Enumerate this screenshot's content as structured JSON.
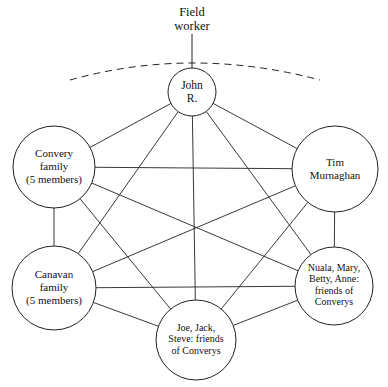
{
  "diagram": {
    "type": "sociogram-network",
    "background_color": "#ffffff",
    "stroke_color": "#222222",
    "text_color": "#111111",
    "width": 388,
    "height": 387,
    "caption": {
      "name": "field-worker-caption",
      "lines": [
        "Field",
        "worker"
      ],
      "line1": "Field",
      "line2": "worker",
      "x": 192,
      "y": 16,
      "line_height": 14,
      "font_size": 12.5
    },
    "boundary_arc": {
      "name": "dashed-boundary-arc",
      "path": "M 70 80 Q 192 46 320 80",
      "dash_pattern": "7 5"
    },
    "field_worker_stem": {
      "name": "field-worker-connector",
      "x": 192,
      "y1": 34,
      "y2": 68
    },
    "nodes": [
      {
        "id": "john-r",
        "label": "John R.",
        "lines": [
          "John",
          "R."
        ],
        "cx": 192,
        "cy": 92,
        "r": 24,
        "font_size": 11.5,
        "line_height": 13
      },
      {
        "id": "convery-family",
        "label": "Convery family (5 members)",
        "lines": [
          "Convery",
          "family",
          "(5 members)"
        ],
        "cx": 54,
        "cy": 167,
        "r": 41,
        "font_size": 11,
        "line_height": 13
      },
      {
        "id": "tim-murnaghan",
        "label": "Tim Murnaghan",
        "lines": [
          "Tim",
          "Murnaghan"
        ],
        "cx": 335,
        "cy": 169,
        "r": 43,
        "font_size": 11,
        "line_height": 13
      },
      {
        "id": "canavan-family",
        "label": "Canavan family (5 members)",
        "lines": [
          "Canavan",
          "family",
          "(5 members)"
        ],
        "cx": 54,
        "cy": 288,
        "r": 42,
        "font_size": 11,
        "line_height": 13
      },
      {
        "id": "nuala-group",
        "label": "Nuala, Mary, Betty, Anne: friends of Converys",
        "lines": [
          "Nuala, Mary,",
          "Betty, Anne:",
          "friends of",
          "Converys"
        ],
        "cx": 334,
        "cy": 286,
        "r": 39,
        "font_size": 10,
        "line_height": 11.5
      },
      {
        "id": "joe-group",
        "label": "Joe, Jack, Steve: friends of Converys",
        "lines": [
          "Joe, Jack,",
          "Steve: friends",
          "of Converys"
        ],
        "cx": 196,
        "cy": 340,
        "r": 40,
        "font_size": 10,
        "line_height": 11.5
      }
    ],
    "edges": [
      {
        "from": "john-r",
        "to": "convery-family"
      },
      {
        "from": "john-r",
        "to": "tim-murnaghan"
      },
      {
        "from": "john-r",
        "to": "canavan-family"
      },
      {
        "from": "john-r",
        "to": "nuala-group"
      },
      {
        "from": "john-r",
        "to": "joe-group"
      },
      {
        "from": "convery-family",
        "to": "tim-murnaghan"
      },
      {
        "from": "convery-family",
        "to": "canavan-family"
      },
      {
        "from": "convery-family",
        "to": "nuala-group"
      },
      {
        "from": "convery-family",
        "to": "joe-group"
      },
      {
        "from": "tim-murnaghan",
        "to": "canavan-family"
      },
      {
        "from": "tim-murnaghan",
        "to": "nuala-group"
      },
      {
        "from": "tim-murnaghan",
        "to": "joe-group"
      },
      {
        "from": "canavan-family",
        "to": "nuala-group"
      },
      {
        "from": "canavan-family",
        "to": "joe-group"
      },
      {
        "from": "nuala-group",
        "to": "joe-group"
      }
    ],
    "edge_count": 15,
    "node_count": 6
  }
}
